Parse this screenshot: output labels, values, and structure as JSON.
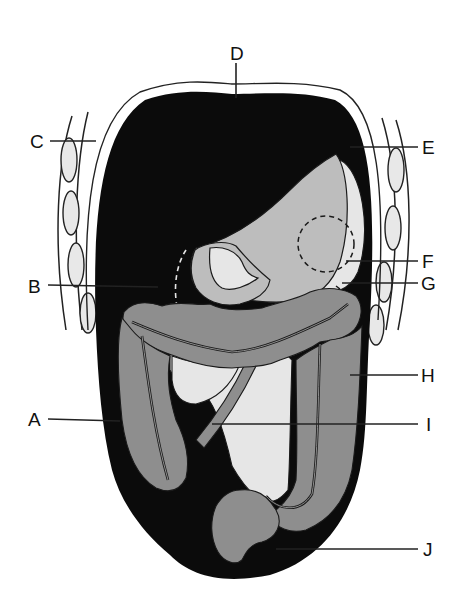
{
  "diagram": {
    "colors": {
      "background": "#ffffff",
      "cavity": "#0b0b0b",
      "organ_light": "#bdbdbd",
      "organ_pale": "#e6e6e6",
      "colon": "#8e8e8e",
      "outline": "#1a1a1a"
    },
    "labels": [
      {
        "id": "A",
        "text": "A",
        "x": 30,
        "y": 420,
        "side": "left"
      },
      {
        "id": "B",
        "text": "B",
        "x": 30,
        "y": 287,
        "side": "left"
      },
      {
        "id": "C",
        "text": "C",
        "x": 30,
        "y": 142,
        "side": "left"
      },
      {
        "id": "D",
        "text": "D",
        "x": 230,
        "y": 55,
        "side": "top"
      },
      {
        "id": "E",
        "text": "E",
        "x": 425,
        "y": 148,
        "side": "right"
      },
      {
        "id": "F",
        "text": "F",
        "x": 425,
        "y": 262,
        "side": "right"
      },
      {
        "id": "G",
        "text": "G",
        "x": 425,
        "y": 284,
        "side": "right"
      },
      {
        "id": "H",
        "text": "H",
        "x": 425,
        "y": 375,
        "side": "right"
      },
      {
        "id": "I",
        "text": "I",
        "x": 425,
        "y": 424,
        "side": "right"
      },
      {
        "id": "J",
        "text": "J",
        "x": 425,
        "y": 549,
        "side": "right"
      }
    ]
  }
}
